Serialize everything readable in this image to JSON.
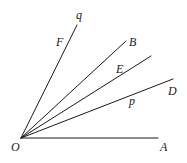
{
  "diagram": {
    "title": "",
    "vertex": {
      "label": "O",
      "x": 21,
      "y": 138,
      "label_x": 11,
      "label_y": 151
    },
    "rays": [
      {
        "id": "OA",
        "x2": 158,
        "y2": 138
      },
      {
        "id": "OD",
        "x2": 173,
        "y2": 79
      },
      {
        "id": "OE",
        "x2": 151,
        "y2": 56
      },
      {
        "id": "OB",
        "x2": 126,
        "y2": 41
      },
      {
        "id": "Oq",
        "x2": 77,
        "y2": 25
      }
    ],
    "labels": [
      {
        "text": "A",
        "x": 160,
        "y": 151
      },
      {
        "text": "D",
        "x": 168,
        "y": 95
      },
      {
        "text": "p",
        "x": 129,
        "y": 105
      },
      {
        "text": "E",
        "x": 116,
        "y": 73
      },
      {
        "text": "B",
        "x": 129,
        "y": 46
      },
      {
        "text": "F",
        "x": 56,
        "y": 46
      },
      {
        "text": "q",
        "x": 76,
        "y": 19
      }
    ],
    "stroke_color": "#1a1a1a",
    "background": "#ffffff"
  }
}
